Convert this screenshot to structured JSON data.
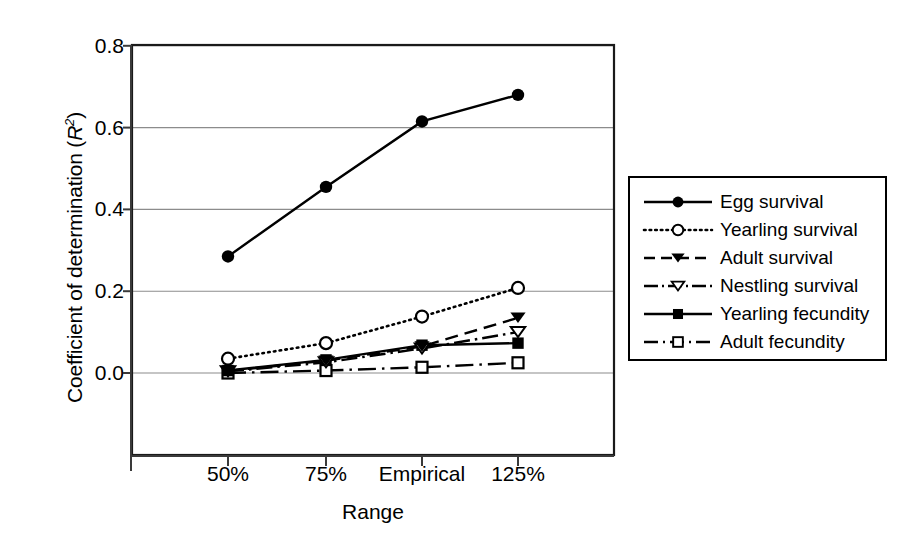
{
  "chart_data": {
    "type": "line",
    "title": "",
    "xlabel": "Range",
    "ylabel": "Coefficient of determination (R2)",
    "ylabel_main": "Coefficient of determination (",
    "ylabel_italic": "R",
    "ylabel_sup": "2",
    "ylabel_close": ")",
    "categories": [
      "50%",
      "75%",
      "Empirical",
      "125%"
    ],
    "ylim": [
      0.0,
      0.8
    ],
    "yticks": [
      "0.0",
      "0.2",
      "0.4",
      "0.6",
      "0.8"
    ],
    "ytick_values": [
      0.0,
      0.2,
      0.4,
      0.6,
      0.8
    ],
    "grid": "horizontal",
    "legend_position": "right-outside",
    "series": [
      {
        "name": "Egg survival",
        "marker": "filled-circle",
        "linestyle": "solid",
        "values": [
          0.285,
          0.455,
          0.615,
          0.68
        ]
      },
      {
        "name": "Yearling survival",
        "marker": "open-circle",
        "linestyle": "dotted",
        "values": [
          0.035,
          0.073,
          0.138,
          0.208
        ]
      },
      {
        "name": "Adult survival",
        "marker": "filled-triangle-down",
        "linestyle": "dashed",
        "values": [
          0.005,
          0.03,
          0.065,
          0.135
        ]
      },
      {
        "name": "Nestling survival",
        "marker": "open-triangle-down",
        "linestyle": "dash-dot",
        "values": [
          0.004,
          0.026,
          0.06,
          0.1
        ]
      },
      {
        "name": "Yearling fecundity",
        "marker": "filled-square",
        "linestyle": "solid-short",
        "values": [
          0.006,
          0.032,
          0.068,
          0.073
        ]
      },
      {
        "name": "Adult fecundity",
        "marker": "open-square",
        "linestyle": "dash-dot-long",
        "values": [
          0.0,
          0.006,
          0.014,
          0.025
        ]
      }
    ]
  },
  "legend": {
    "items": [
      "Egg survival",
      "Yearling survival",
      "Adult survival",
      "Nestling survival",
      "Yearling fecundity",
      "Adult fecundity"
    ]
  }
}
